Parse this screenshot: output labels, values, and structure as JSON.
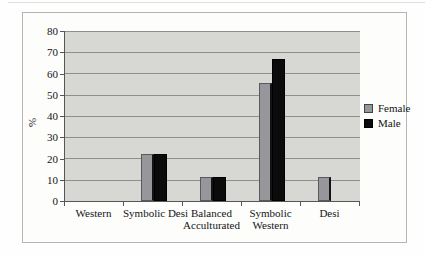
{
  "chart_data": {
    "type": "bar",
    "title": "",
    "xlabel": "",
    "ylabel": "%",
    "categories": [
      "Western",
      "Symbolic Desi",
      "Balanced Acculturated",
      "Symbolic Western",
      "Desi"
    ],
    "category_label_lines": [
      [
        "Western"
      ],
      [
        "Symbolic Desi"
      ],
      [
        "Balanced",
        "Acculturated"
      ],
      [
        "Symbolic",
        "Western"
      ],
      [
        "Desi"
      ]
    ],
    "series": [
      {
        "name": "Female",
        "color": "#97979b",
        "values": [
          0,
          22.2,
          11.1,
          55.6,
          11.1
        ]
      },
      {
        "name": "Male",
        "color": "#0b0b0b",
        "values": [
          0,
          22.2,
          11.1,
          66.7,
          0
        ]
      }
    ],
    "ylim": [
      0,
      80
    ],
    "yticks": [
      0,
      10,
      20,
      30,
      40,
      50,
      60,
      70,
      80
    ],
    "grid": true,
    "legend_position": "right",
    "plot_background": "#d7d7d3",
    "gridline_color": "#8f8f8a"
  }
}
